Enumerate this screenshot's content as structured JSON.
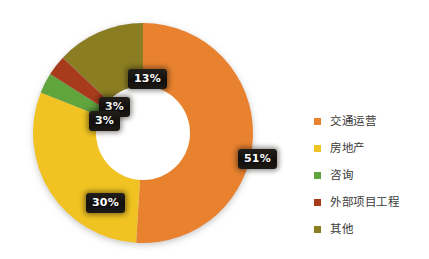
{
  "chart_data": {
    "type": "pie",
    "variant": "donut",
    "title": "",
    "subtitle": "",
    "xlabel": "",
    "ylabel": "",
    "grid": false,
    "legend_position": "right",
    "units": "percent",
    "start_angle_deg": 0,
    "direction": "clockwise",
    "categories": [
      "交通运营",
      "房地产",
      "咨询",
      "外部项目工程",
      "其他"
    ],
    "values": [
      51,
      30,
      3,
      3,
      13
    ],
    "labels": [
      "51%",
      "30%",
      "3%",
      "3%",
      "13%"
    ],
    "colors": [
      "#E8822E",
      "#F0C324",
      "#5FA43C",
      "#A83A1C",
      "#8A7D22"
    ],
    "slices": [
      {
        "name": "交通运营",
        "value": 51,
        "label": "51%",
        "color": "#E8822E"
      },
      {
        "name": "房地产",
        "value": 30,
        "label": "30%",
        "color": "#F0C324"
      },
      {
        "name": "咨询",
        "value": 3,
        "label": "3%",
        "color": "#5FA43C"
      },
      {
        "name": "外部项目工程",
        "value": 3,
        "label": "3%",
        "color": "#A83A1C"
      },
      {
        "name": "其他",
        "value": 13,
        "label": "13%",
        "color": "#8A7D22"
      }
    ]
  },
  "legend": {
    "items": [
      {
        "label": "交通运营",
        "color": "#E8822E"
      },
      {
        "label": "房地产",
        "color": "#F0C324"
      },
      {
        "label": "咨询",
        "color": "#5FA43C"
      },
      {
        "label": "外部项目工程",
        "color": "#A83A1C"
      },
      {
        "label": "其他",
        "color": "#8A7D22"
      }
    ]
  },
  "badges": {
    "transport": "51%",
    "realestate": "30%",
    "consulting": "3%",
    "external": "3%",
    "other": "13%"
  }
}
